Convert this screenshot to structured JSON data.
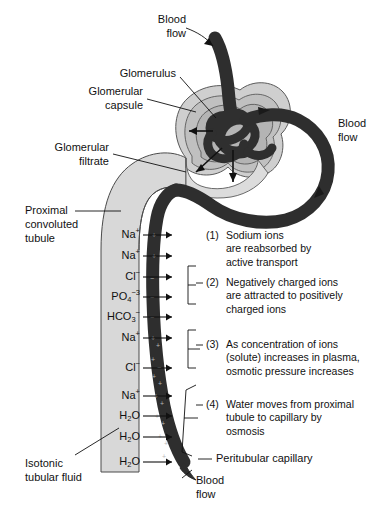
{
  "figure": {
    "title_present": false,
    "colors": {
      "capillary": "#2e2e2e",
      "tubule_fill": "#d8d8d8",
      "capsule_fill": "#c9c9c9",
      "capsule_fill_light": "#e2e2e2",
      "text": "#111111",
      "background": "#ffffff"
    }
  },
  "labels": {
    "blood_flow_top": "Blood\nflow",
    "blood_flow_top_line1": "Blood",
    "blood_flow_top_line2": "flow",
    "glomerulus": "Glomerulus",
    "glomerular_capsule_line1": "Glomerular",
    "glomerular_capsule_line2": "capsule",
    "blood_flow_right_line1": "Blood",
    "blood_flow_right_line2": "flow",
    "glomerular_filtrate_line1": "Glomerular",
    "glomerular_filtrate_line2": "filtrate",
    "proximal_tubule_line1": "Proximal",
    "proximal_tubule_line2": "convoluted",
    "proximal_tubule_line3": "tubule",
    "isotonic_fluid_line1": "Isotonic",
    "isotonic_fluid_line2": "tubular fluid",
    "peritubular_capillary": "Peritubular capillary",
    "blood_flow_bottom_line1": "Blood",
    "blood_flow_bottom_line2": "flow"
  },
  "ions": [
    {
      "base": "Na",
      "sup": "+",
      "sub": "",
      "y": 235
    },
    {
      "base": "Na",
      "sup": "+",
      "sub": "",
      "y": 256
    },
    {
      "base": "Cl",
      "sup": "−",
      "sub": "",
      "y": 277
    },
    {
      "base": "PO",
      "sup": "−3",
      "sub": "4",
      "y": 297
    },
    {
      "base": "HCO",
      "sup": "−",
      "sub": "3",
      "y": 317
    },
    {
      "base": "Na",
      "sup": "+",
      "sub": "",
      "y": 338
    },
    {
      "base": "Cl",
      "sup": "−",
      "sub": "",
      "y": 368
    },
    {
      "base": "Na",
      "sup": "+",
      "sub": "",
      "y": 396
    },
    {
      "base": "H",
      "sup": "",
      "sub": "2",
      "tail": "O",
      "y": 416
    },
    {
      "base": "H",
      "sup": "",
      "sub": "2",
      "tail": "O",
      "y": 437
    },
    {
      "base": "H",
      "sup": "",
      "sub": "2",
      "tail": "O",
      "y": 462
    }
  ],
  "notes": [
    {
      "number": "(1)",
      "lines": [
        "Sodium ions",
        "are reabsorbed by",
        "active transport"
      ],
      "y": 236,
      "bracketed": false
    },
    {
      "number": "(2)",
      "lines": [
        "Negatively charged ions",
        "are attracted to positively",
        "charged ions"
      ],
      "y": 283,
      "bracketed": true
    },
    {
      "number": "(3)",
      "lines": [
        "As concentration of ions",
        "(solute) increases in plasma,",
        "osmotic pressure increases"
      ],
      "y": 345,
      "bracketed": true
    },
    {
      "number": "(4)",
      "lines": [
        "Water moves from proximal",
        "tubule to capillary by",
        "osmosis"
      ],
      "y": 405,
      "bracketed": true
    }
  ]
}
